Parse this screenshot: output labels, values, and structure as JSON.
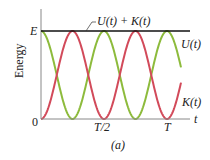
{
  "chart_data": {
    "type": "line",
    "title": "",
    "caption": "(a)",
    "xlabel": "t",
    "ylabel": "Energy",
    "x_ticks": [
      "0",
      "T/2",
      "T"
    ],
    "y_ticks": [
      "0",
      "E"
    ],
    "xlim": [
      0,
      1.2
    ],
    "ylim": [
      0,
      1
    ],
    "grid": false,
    "legend": "inline labels",
    "series": [
      {
        "name": "U(t) + K(t)",
        "color": "#111111",
        "formula": "E (constant)",
        "x": [
          0,
          1.2
        ],
        "values": [
          1,
          1
        ]
      },
      {
        "name": "U(t)",
        "color": "#8dbb3c",
        "formula": "E cos^2(2πt/T)",
        "x": [
          0,
          0.125,
          0.25,
          0.375,
          0.5,
          0.625,
          0.75,
          0.875,
          1.0,
          1.1
        ],
        "values": [
          1,
          0.5,
          0,
          0.5,
          1,
          0.5,
          0,
          0.5,
          1,
          0.65
        ]
      },
      {
        "name": "K(t)",
        "color": "#d24a5a",
        "formula": "E sin^2(2πt/T)",
        "x": [
          0,
          0.125,
          0.25,
          0.375,
          0.5,
          0.625,
          0.75,
          0.875,
          1.0,
          1.1
        ],
        "values": [
          0,
          0.5,
          1,
          0.5,
          0,
          0.5,
          1,
          0.5,
          0,
          0.35
        ]
      }
    ]
  },
  "labels": {
    "sum": "U(t) + K(t)",
    "u": "U(t)",
    "k": "K(t)",
    "e": "E",
    "zero": "0",
    "half": "T/2",
    "full": "T",
    "t": "t",
    "ylabel": "Energy",
    "caption": "(a)"
  }
}
